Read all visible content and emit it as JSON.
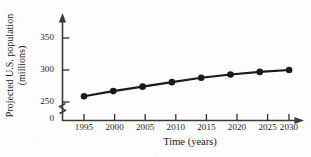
{
  "chart_data": {
    "type": "line",
    "title": "",
    "subtitle": "",
    "xlabel": "Time (years)",
    "ylabel_line1": "Projected U.S. population",
    "ylabel_line2": "(millions)",
    "ylabel": "Projected U.S. population (millions)",
    "categories": [
      "1995",
      "2000",
      "2005",
      "2010",
      "2015",
      "2020",
      "2025",
      "2030"
    ],
    "x": [
      1995,
      2000,
      2005,
      2010,
      2015,
      2020,
      2025,
      2030
    ],
    "values": [
      259,
      267,
      274,
      281,
      288,
      293,
      297,
      300
    ],
    "series": [
      {
        "name": "Projected U.S. population",
        "values": [
          259,
          267,
          274,
          281,
          288,
          293,
          297,
          300
        ]
      }
    ],
    "xtick_labels": [
      "1995",
      "2000",
      "2005",
      "2010",
      "2015",
      "2020",
      "2025",
      "2030"
    ],
    "ytick_labels": [
      "0",
      "250",
      "300",
      "350"
    ],
    "ytick_values": [
      0,
      250,
      300,
      350
    ],
    "ylim": [
      250,
      360
    ],
    "xlim": [
      1995,
      2030
    ],
    "axis_break": true,
    "axis_break_note": "zigzag break on y-axis between 0 and 250",
    "grid": false,
    "legend": false,
    "legend_position": "none",
    "marker": "filled-circle",
    "marker_color": "#1a1a1a",
    "line_color": "#1a1a1a",
    "axis_color": "#3a3a3a",
    "background_color": "#fdfdfc",
    "x_axis_arrow": true,
    "y_axis_arrow": true
  },
  "icons": {
    "y_axis_arrow": "arrow-up-icon",
    "x_axis_arrow": "arrow-right-icon",
    "axis_break": "axis-break-zigzag-icon"
  }
}
